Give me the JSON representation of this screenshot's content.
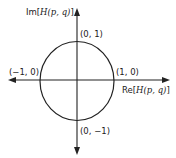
{
  "diagram": {
    "axes": {
      "y_label_prefix": "Im[",
      "y_label_math": "H(p, q)",
      "y_label_suffix": "]",
      "x_label_prefix": "Re[",
      "x_label_math": "H(p, q)",
      "x_label_suffix": "]"
    },
    "points": {
      "top": "(0, 1)",
      "bottom": "(0, −1)",
      "left": "(−1, 0)",
      "right": "(1, 0)"
    },
    "colors": {
      "stroke": "#222222",
      "background": "#ffffff"
    }
  }
}
